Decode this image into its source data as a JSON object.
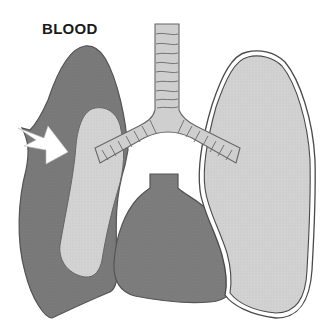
{
  "diagram": {
    "title_label": "BLOOD",
    "parts": [
      {
        "name": "trachea",
        "description": "Windpipe with cartilage rings"
      },
      {
        "name": "left-bronchus",
        "description": "Bronchus branching to left lung"
      },
      {
        "name": "right-bronchus",
        "description": "Bronchus branching to right lung"
      },
      {
        "name": "left-lung",
        "description": "Lung filled with blood (dark)"
      },
      {
        "name": "collapsed-lung",
        "description": "Compressed light lung inside blood-filled cavity"
      },
      {
        "name": "right-lung",
        "description": "Normal lung with pleural outline"
      },
      {
        "name": "heart",
        "description": "Heart at bottom center"
      },
      {
        "name": "arrow",
        "description": "White arrow pointing into blood-filled cavity"
      }
    ],
    "colors": {
      "blood": "#7a7a7a",
      "lung_light": "#d2d2d2",
      "heart": "#7d7d7d",
      "trachea": "#cfcfcf",
      "outline": "#4a4a4a",
      "background": "#ffffff"
    }
  }
}
